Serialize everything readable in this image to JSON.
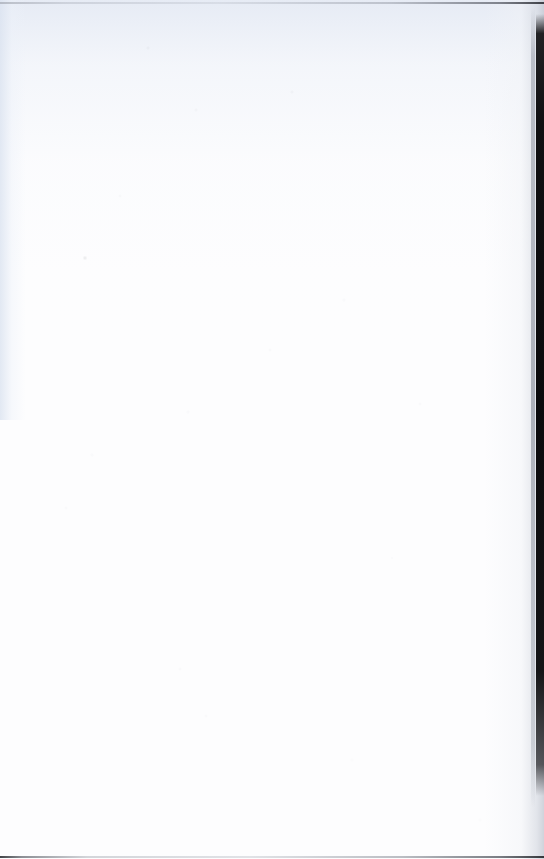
{
  "document": {
    "page_type": "blank-page",
    "text_content": "",
    "visible_text_blocks": [],
    "page_number": "",
    "header": "",
    "footer": ""
  },
  "canvas": {
    "width": 544,
    "height": 859
  },
  "colors": {
    "paper": "#fdfdfe",
    "paper_tint": "#e2e8f3",
    "edge_dark": "#0a0a0c",
    "edge_rule_gray": "#949aa2",
    "gutter_shadow": "#c4c8d2"
  },
  "scan_artifacts": {
    "top_rule": {
      "name": "top-edge-rule",
      "thickness_px": 2,
      "y_px": 2,
      "description": "thin gray horizontal rule spanning full width, darkening toward the right"
    },
    "bottom_rule": {
      "name": "bottom-edge-rule",
      "thickness_px": 2,
      "y_px": 856,
      "description": "thin gray horizontal rule spanning full width, darkest at the left and right extremes"
    },
    "right_edge_strip": {
      "name": "right-page-edge-shadow",
      "x_px": 536,
      "width_px": 8,
      "y_start_px": 14,
      "y_end_px": 796,
      "description": "near-black vertical book gutter / page edge shadow, fades out before the bottom corner"
    },
    "tint_gradient": {
      "name": "upper-bluish-scanner-tint",
      "region": "top third of page and left margin",
      "description": "faint cool bluish-gray cast from scanning, fading to pure white below"
    },
    "speckle": {
      "name": "dust-and-compression-speckle",
      "description": "scattered faint gray specks from scanner dust and JPEG compression noise"
    }
  }
}
